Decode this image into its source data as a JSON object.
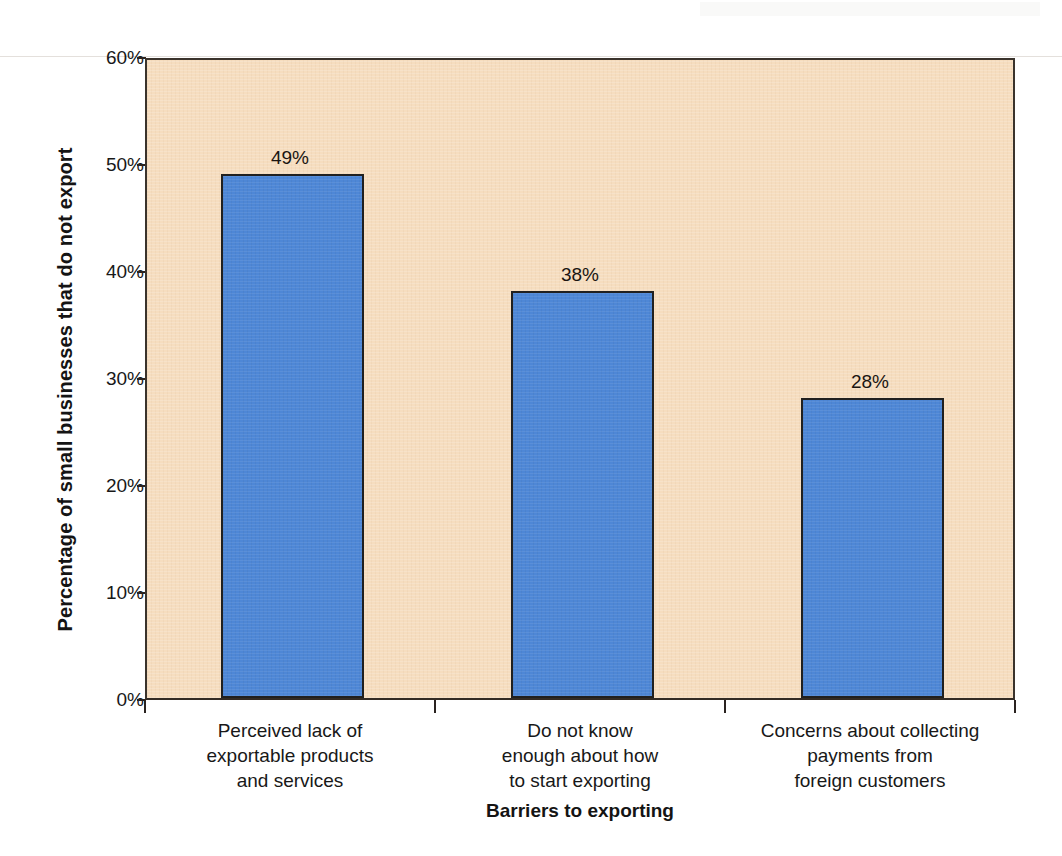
{
  "chart_data": {
    "type": "bar",
    "title": "",
    "subtitle": "",
    "xlabel": "Barriers to exporting",
    "ylabel": "Percentage of small businesses that  do not export",
    "categories": [
      "Perceived lack of exportable products and services",
      "Do not know enough about how to start exporting",
      "Concerns about collecting payments from foreign customers"
    ],
    "category_lines": [
      [
        "Perceived lack of",
        "exportable products",
        "and services"
      ],
      [
        "Do not know",
        "enough about how",
        "to start exporting"
      ],
      [
        "Concerns about collecting",
        "payments from",
        "foreign customers"
      ]
    ],
    "values": [
      49,
      38,
      28
    ],
    "value_labels": [
      "49%",
      "38%",
      "28%"
    ],
    "ylim": [
      0,
      60
    ],
    "ytick_values": [
      0,
      10,
      20,
      30,
      40,
      50,
      60
    ],
    "ytick_labels": [
      "0%",
      "10%",
      "20%",
      "30%",
      "40%",
      "50%",
      "60%"
    ],
    "grid": false,
    "legend": false,
    "legend_position": "none",
    "colors": {
      "bar_fill": "#4e87d6",
      "bar_border": "#21201f",
      "plot_background": "#f6ddbf",
      "axis_line": "#332b24",
      "page_background": "#ffffff",
      "text": "#181818"
    }
  }
}
